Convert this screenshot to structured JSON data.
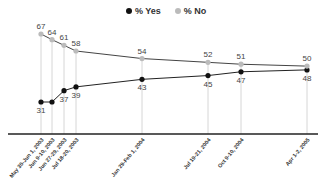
{
  "chart_data": {
    "type": "line",
    "title": "",
    "xlabel": "",
    "ylabel": "",
    "legend_position": "top",
    "grid": false,
    "categories": [
      "May 30-Jun 1, 2003",
      "Jun 9-10, 2003",
      "Jun 27-29, 2003",
      "Jul 18-20, 2003",
      "Jan 29-Feb 1, 2004",
      "Jul 19-21, 2004",
      "Oct 9-10, 2004",
      "Apr 1-2, 2005"
    ],
    "x_positions": [
      41,
      52,
      64,
      76,
      142,
      208,
      241,
      307
    ],
    "series": [
      {
        "name": "% Yes",
        "color": "#111111",
        "values": [
          31,
          31,
          37,
          39,
          43,
          45,
          47,
          48
        ],
        "labels": [
          "31",
          "",
          "37",
          "39",
          "43",
          "45",
          "47",
          "48"
        ]
      },
      {
        "name": "% No",
        "color": "#bbbbbb",
        "values": [
          67,
          64,
          61,
          58,
          54,
          52,
          51,
          50
        ],
        "labels": [
          "67",
          "64",
          "61",
          "58",
          "54",
          "52",
          "51",
          "50"
        ]
      }
    ]
  },
  "legend": {
    "yes": "% Yes",
    "no": "% No"
  }
}
